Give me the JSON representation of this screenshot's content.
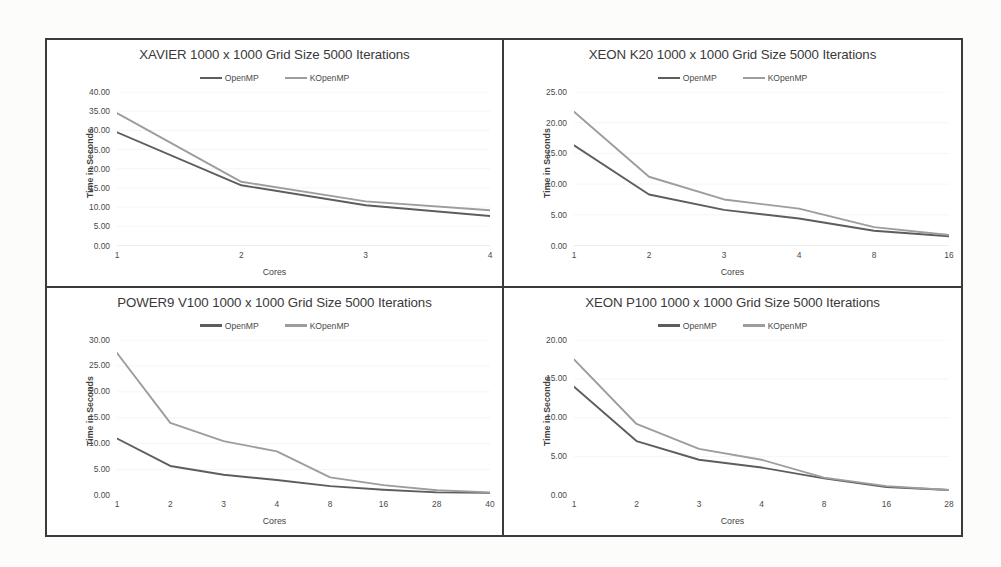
{
  "document": {
    "kind": "scanned-figure",
    "panel_border_color": "#3b3b3b",
    "series_colors": {
      "OpenMP": "#5d5d5d",
      "KOpenMP": "#9d9d9d"
    }
  },
  "legend": {
    "openmp_label": "OpenMP",
    "kopenmp_label": "KOpenMP"
  },
  "axis": {
    "xlabel": "Cores",
    "ylabel": "Time in Seconds"
  },
  "chart_data": [
    {
      "id": "xavier",
      "type": "line",
      "title": "XAVIER 1000 x 1000 Grid Size 5000 Iterations",
      "xlabel": "Cores",
      "ylabel": "Time in Seconds",
      "categories": [
        "1",
        "2",
        "3",
        "4"
      ],
      "ylim": [
        0,
        40
      ],
      "ytick_step": 5,
      "yticks": [
        "0.00",
        "5.00",
        "10.00",
        "15.00",
        "20.00",
        "25.00",
        "30.00",
        "35.00",
        "40.00"
      ],
      "grid": true,
      "legend_position": "top",
      "series": [
        {
          "name": "OpenMP",
          "color": "#5d5d5d",
          "values": [
            29.5,
            15.7,
            10.5,
            7.7
          ]
        },
        {
          "name": "KOpenMP",
          "color": "#9d9d9d",
          "values": [
            34.5,
            16.6,
            11.5,
            9.2
          ]
        }
      ]
    },
    {
      "id": "xeon-k20",
      "type": "line",
      "title": "XEON K20 1000 x 1000 Grid Size 5000 Iterations",
      "xlabel": "Cores",
      "ylabel": "Time in Seconds",
      "categories": [
        "1",
        "2",
        "3",
        "4",
        "8",
        "16"
      ],
      "ylim": [
        0,
        25
      ],
      "ytick_step": 5,
      "yticks": [
        "0.00",
        "5.00",
        "10.00",
        "15.00",
        "20.00",
        "25.00"
      ],
      "grid": true,
      "legend_position": "top",
      "series": [
        {
          "name": "OpenMP",
          "color": "#5d5d5d",
          "values": [
            16.3,
            8.3,
            5.8,
            4.4,
            2.4,
            1.5
          ]
        },
        {
          "name": "KOpenMP",
          "color": "#9d9d9d",
          "values": [
            21.8,
            11.2,
            7.5,
            6.0,
            3.0,
            1.7
          ]
        }
      ]
    },
    {
      "id": "power9-v100",
      "type": "line",
      "title": "POWER9 V100 1000 x 1000 Grid Size 5000 Iterations",
      "xlabel": "Cores",
      "ylabel": "Time in Seconds",
      "categories": [
        "1",
        "2",
        "3",
        "4",
        "8",
        "16",
        "28",
        "40"
      ],
      "ylim": [
        0,
        30
      ],
      "ytick_step": 5,
      "yticks": [
        "0.00",
        "5.00",
        "10.00",
        "15.00",
        "20.00",
        "25.00",
        "30.00"
      ],
      "grid": true,
      "legend_position": "top",
      "series": [
        {
          "name": "OpenMP",
          "color": "#5d5d5d",
          "values": [
            11.0,
            5.7,
            4.0,
            3.0,
            1.8,
            1.1,
            0.6,
            0.5
          ]
        },
        {
          "name": "KOpenMP",
          "color": "#9d9d9d",
          "values": [
            27.5,
            14.0,
            10.5,
            8.5,
            3.5,
            2.0,
            1.0,
            0.6
          ]
        }
      ]
    },
    {
      "id": "xeon-p100",
      "type": "line",
      "title": "XEON P100 1000 x 1000 Grid Size 5000 Iterations",
      "xlabel": "Cores",
      "ylabel": "Time in Seconds",
      "categories": [
        "1",
        "2",
        "3",
        "4",
        "8",
        "16",
        "28"
      ],
      "ylim": [
        0,
        20
      ],
      "ytick_step": 5,
      "yticks": [
        "0.00",
        "5.00",
        "10.00",
        "15.00",
        "20.00"
      ],
      "grid": true,
      "legend_position": "top",
      "series": [
        {
          "name": "OpenMP",
          "color": "#5d5d5d",
          "values": [
            14.0,
            7.0,
            4.6,
            3.6,
            2.2,
            1.1,
            0.7
          ]
        },
        {
          "name": "KOpenMP",
          "color": "#9d9d9d",
          "values": [
            17.5,
            9.2,
            6.0,
            4.6,
            2.3,
            1.2,
            0.7
          ]
        }
      ]
    }
  ]
}
